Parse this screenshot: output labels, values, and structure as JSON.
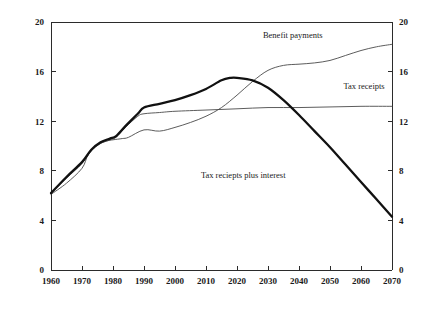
{
  "chart_data": {
    "type": "line",
    "title": "",
    "subtitle": "",
    "xlabel": "",
    "ylabel": "",
    "xlim": [
      1960,
      2070
    ],
    "ylim": [
      0,
      20
    ],
    "grid": false,
    "legend_position": "inline-annotations",
    "x_ticks": [
      "1960",
      "1970",
      "1980",
      "1990",
      "2000",
      "2010",
      "2020",
      "2030",
      "2040",
      "2050",
      "2060",
      "2070"
    ],
    "y_ticks_left": [
      "0",
      "4",
      "8",
      "12",
      "16",
      "20"
    ],
    "y_ticks_right": [
      "0",
      "4",
      "8",
      "12",
      "16",
      "20"
    ],
    "annotations": [
      {
        "text": "Benefit payments",
        "x": 2038,
        "y": 18.7
      },
      {
        "text": "Tax receipts",
        "x": 2061,
        "y": 14.6
      },
      {
        "text": "Tax reciepts plus interest",
        "x": 2022,
        "y": 7.4
      }
    ],
    "series": [
      {
        "name": "Benefit payments",
        "style": "thin",
        "color": "#4a4a4a",
        "width": 0.9,
        "x": [
          1960,
          1965,
          1970,
          1972,
          1975,
          1978,
          1980,
          1983,
          1985,
          1990,
          1995,
          2000,
          2005,
          2010,
          2015,
          2020,
          2025,
          2030,
          2035,
          2040,
          2045,
          2050,
          2055,
          2060,
          2065,
          2070
        ],
        "y": [
          6.1,
          7.0,
          8.2,
          9.3,
          10.1,
          10.4,
          10.5,
          10.6,
          10.7,
          11.3,
          11.2,
          11.5,
          11.9,
          12.4,
          13.1,
          14.1,
          15.2,
          16.1,
          16.5,
          16.6,
          16.7,
          16.9,
          17.3,
          17.7,
          18.0,
          18.2
        ]
      },
      {
        "name": "Tax receipts",
        "style": "thin",
        "color": "#4a4a4a",
        "width": 0.9,
        "x": [
          1960,
          1965,
          1970,
          1973,
          1976,
          1979,
          1981,
          1984,
          1988,
          1990,
          1995,
          2000,
          2010,
          2020,
          2030,
          2040,
          2050,
          2060,
          2070
        ],
        "y": [
          6.2,
          7.4,
          8.6,
          9.6,
          10.2,
          10.5,
          10.7,
          11.5,
          12.4,
          12.6,
          12.7,
          12.8,
          12.9,
          13.0,
          13.1,
          13.1,
          13.15,
          13.2,
          13.2
        ]
      },
      {
        "name": "Tax reciepts plus interest",
        "style": "bold",
        "color": "#111111",
        "width": 2.3,
        "x": [
          1960,
          1965,
          1970,
          1973,
          1976,
          1979,
          1981,
          1984,
          1988,
          1990,
          1995,
          2000,
          2005,
          2010,
          2015,
          2018,
          2020,
          2025,
          2030,
          2035,
          2040,
          2045,
          2050,
          2055,
          2060,
          2065,
          2070
        ],
        "y": [
          6.2,
          7.5,
          8.7,
          9.7,
          10.3,
          10.6,
          10.8,
          11.6,
          12.6,
          13.1,
          13.4,
          13.7,
          14.1,
          14.6,
          15.3,
          15.5,
          15.5,
          15.3,
          14.7,
          13.7,
          12.5,
          11.2,
          9.9,
          8.5,
          7.1,
          5.7,
          4.3
        ]
      }
    ]
  },
  "axes": {
    "plot_left_px": 51,
    "plot_right_px": 392,
    "plot_top_px": 22,
    "plot_bottom_px": 270
  }
}
